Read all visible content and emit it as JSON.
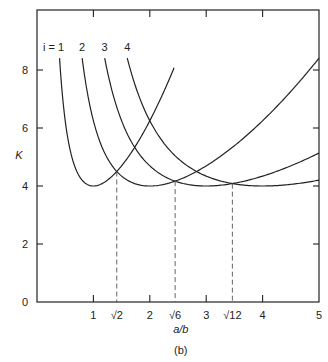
{
  "caption": "(b)",
  "chart_data": {
    "type": "line",
    "title": "",
    "xlabel": "a/b",
    "ylabel": "K",
    "xlim": [
      0,
      5
    ],
    "ylim": [
      0,
      10
    ],
    "x_ticks": [
      {
        "value": 1,
        "label": "1"
      },
      {
        "value": 1.4142,
        "label": "√2"
      },
      {
        "value": 2,
        "label": "2"
      },
      {
        "value": 2.4495,
        "label": "√6"
      },
      {
        "value": 3,
        "label": "3"
      },
      {
        "value": 3.4641,
        "label": "√12"
      },
      {
        "value": 4,
        "label": "4"
      },
      {
        "value": 5,
        "label": "5"
      }
    ],
    "y_ticks": [
      {
        "value": 0,
        "label": "0"
      },
      {
        "value": 2,
        "label": "2"
      },
      {
        "value": 4,
        "label": "4"
      },
      {
        "value": 6,
        "label": "6"
      },
      {
        "value": 8,
        "label": "8"
      }
    ],
    "grid": false,
    "formula": "K = (i·b/a + a/(i·b))^2",
    "series": [
      {
        "name": "i = 1",
        "label": "i = 1",
        "x_range": [
          0.4,
          2.43
        ],
        "points": [
          [
            0.4,
            8.41
          ],
          [
            0.5,
            6.25
          ],
          [
            0.7,
            4.51
          ],
          [
            1.0,
            4.0
          ],
          [
            1.414,
            4.5
          ],
          [
            2.0,
            6.25
          ],
          [
            2.43,
            8.08
          ]
        ]
      },
      {
        "name": "i = 2",
        "label": "2",
        "x_range": [
          0.8,
          5
        ],
        "points": [
          [
            0.8,
            8.41
          ],
          [
            1.0,
            6.25
          ],
          [
            1.414,
            4.5
          ],
          [
            2.0,
            4.0
          ],
          [
            2.449,
            4.17
          ],
          [
            3.0,
            4.69
          ],
          [
            4.0,
            6.25
          ],
          [
            5.0,
            8.41
          ]
        ]
      },
      {
        "name": "i = 3",
        "label": "3",
        "x_range": [
          1.2,
          5
        ],
        "points": [
          [
            1.2,
            8.41
          ],
          [
            1.5,
            6.25
          ],
          [
            2.0,
            4.69
          ],
          [
            2.449,
            4.17
          ],
          [
            3.0,
            4.0
          ],
          [
            3.464,
            4.08
          ],
          [
            4.0,
            4.34
          ],
          [
            5.0,
            5.14
          ]
        ]
      },
      {
        "name": "i = 4",
        "label": "4",
        "x_range": [
          1.6,
          5
        ],
        "points": [
          [
            1.6,
            8.41
          ],
          [
            2.0,
            6.25
          ],
          [
            2.449,
            5.03
          ],
          [
            3.0,
            4.34
          ],
          [
            3.464,
            4.08
          ],
          [
            4.0,
            4.0
          ],
          [
            5.0,
            4.2
          ]
        ]
      }
    ],
    "reference_lines": [
      {
        "type": "vertical-dashed",
        "x": 1.4142,
        "label": "√2",
        "to_K": 4.5
      },
      {
        "type": "vertical-dashed",
        "x": 2.4495,
        "label": "√6",
        "to_K": 4.17
      },
      {
        "type": "vertical-dashed",
        "x": 3.4641,
        "label": "√12",
        "to_K": 4.08
      }
    ]
  }
}
